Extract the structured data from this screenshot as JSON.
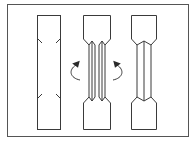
{
  "diagram": {
    "description": "Three-step illustration of folding a flat strip into a dog-bone tensile specimen shape",
    "colors": {
      "stroke": "#3a3a3a",
      "frame": "#555555",
      "background": "#ffffff"
    },
    "panels": [
      {
        "id": "flat-strip-with-cut-marks",
        "label": ""
      },
      {
        "id": "folding-sides-inward",
        "label": ""
      },
      {
        "id": "folded-dogbone-specimen",
        "label": ""
      }
    ],
    "arrows": [
      {
        "id": "fold-arrow-left",
        "direction": "curved-up-right"
      },
      {
        "id": "fold-arrow-right",
        "direction": "curved-up-left"
      }
    ]
  }
}
